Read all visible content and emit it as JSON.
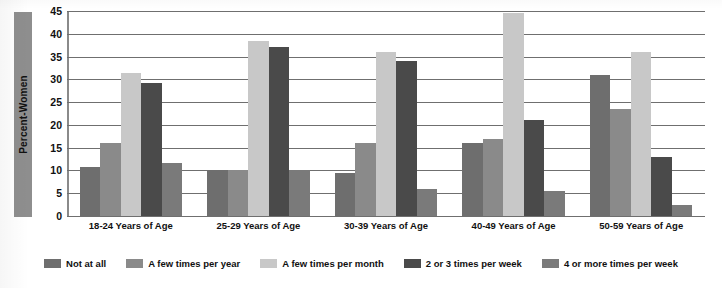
{
  "chart_data": {
    "type": "bar",
    "title": "",
    "xlabel": "",
    "ylabel": "Percent-Women",
    "ylim": [
      0,
      45
    ],
    "ytick_step": 5,
    "yticks": [
      0,
      5,
      10,
      15,
      20,
      25,
      30,
      35,
      40,
      45
    ],
    "grid": true,
    "legend_position": "bottom",
    "categories": [
      "18-24 Years of Age",
      "25-29 Years of Age",
      "30-39 Years of Age",
      "40-49 Years of Age",
      "50-59 Years of Age"
    ],
    "series": [
      {
        "name": "Not at all",
        "color": "#6e6e6e",
        "values": [
          10.7,
          10.0,
          9.5,
          16.0,
          31.0
        ]
      },
      {
        "name": "A few times per year",
        "color": "#8a8a8a",
        "values": [
          16.0,
          10.0,
          16.0,
          17.0,
          23.5
        ]
      },
      {
        "name": "A few times per month",
        "color": "#c8c8c8",
        "values": [
          31.3,
          38.5,
          36.0,
          44.5,
          36.0
        ]
      },
      {
        "name": "2 or 3 times per week",
        "color": "#4a4a4a",
        "values": [
          29.3,
          37.0,
          34.0,
          21.0,
          13.0
        ]
      },
      {
        "name": "4 or more times per week",
        "color": "#7a7a7a",
        "values": [
          11.7,
          10.0,
          6.0,
          5.5,
          2.5
        ]
      }
    ]
  },
  "legend": {
    "items": [
      {
        "label": "Not at all",
        "color": "#6e6e6e"
      },
      {
        "label": "A few times per year",
        "color": "#8a8a8a"
      },
      {
        "label": "A few times per month",
        "color": "#c8c8c8"
      },
      {
        "label": "2 or 3 times per week",
        "color": "#4a4a4a"
      },
      {
        "label": "4 or more times per week",
        "color": "#7a7a7a"
      }
    ]
  },
  "colors": {
    "background": "#ffffff",
    "gridline": "#6f6f6f",
    "axis": "#8a8a8a",
    "ylabel_band": "#8e8e8e",
    "text": "#111111"
  }
}
